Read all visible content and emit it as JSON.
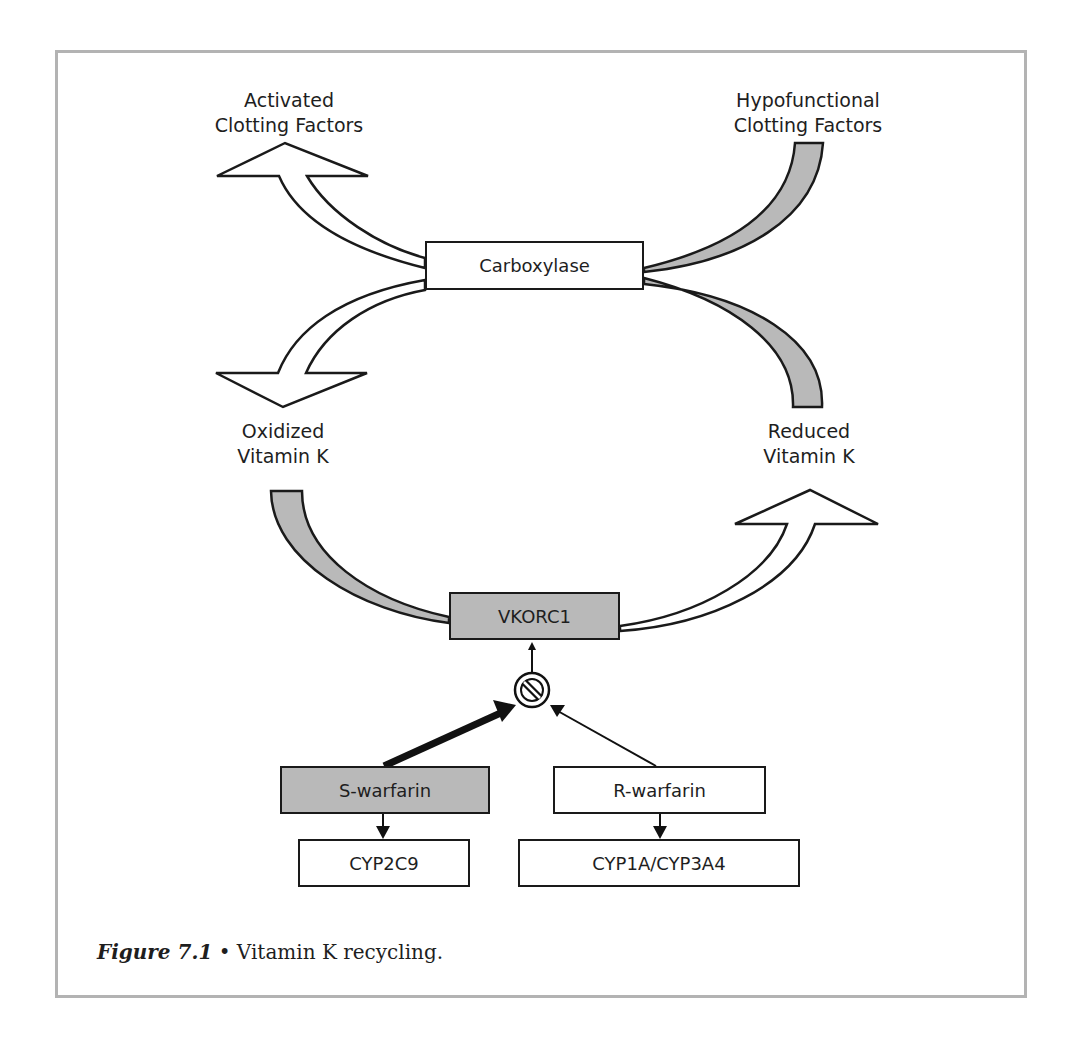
{
  "figure": {
    "caption_label": "Figure 7.1",
    "caption_bullet": "•",
    "caption_text": "Vitamin K recycling."
  },
  "labels": {
    "activated_line1": "Activated",
    "activated_line2": "Clotting Factors",
    "hypofunctional_line1": "Hypofunctional",
    "hypofunctional_line2": "Clotting Factors",
    "oxidized_line1": "Oxidized",
    "oxidized_line2": "Vitamin K",
    "reduced_line1": "Reduced",
    "reduced_line2": "Vitamin K"
  },
  "nodes": {
    "carboxylase": "Carboxylase",
    "vkorc1": "VKORC1",
    "s_warfarin": "S-warfarin",
    "r_warfarin": "R-warfarin",
    "cyp2c9": "CYP2C9",
    "cyp1a_cyp3a4": "CYP1A/CYP3A4"
  },
  "colors": {
    "grey_fill": "#b9b9b9",
    "stroke": "#1a1a1a",
    "frame": "#b3b3b3"
  },
  "icons": {
    "inhibition": "inhibit-icon"
  }
}
